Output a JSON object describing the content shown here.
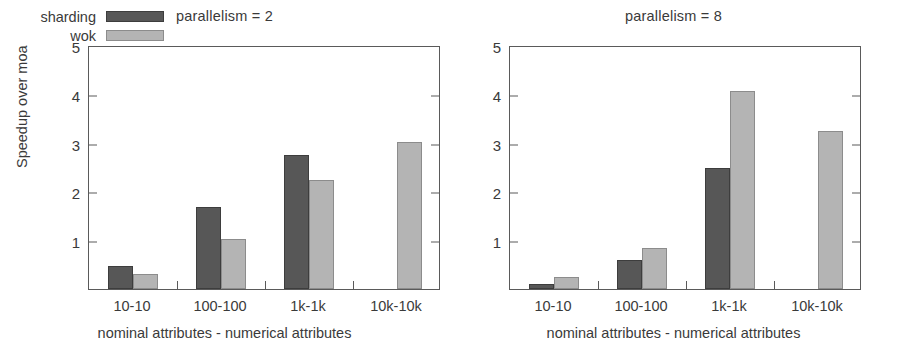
{
  "figure": {
    "y_axis_label": "Speedup over moa",
    "x_axis_label": "nominal attributes - numerical attributes",
    "y_ticks": [
      "1",
      "2",
      "3",
      "4",
      "5"
    ],
    "categories": [
      "10-10",
      "100-100",
      "1k-1k",
      "10k-10k"
    ],
    "legend": [
      {
        "label": "sharding",
        "color": "#575757"
      },
      {
        "label": "wok",
        "color": "#b4b4b4"
      }
    ]
  },
  "panels": [
    {
      "title": "parallelism = 2"
    },
    {
      "title": "parallelism = 8"
    }
  ],
  "chart_data": [
    {
      "type": "bar",
      "title": "parallelism = 2",
      "xlabel": "nominal attributes - numerical attributes",
      "ylabel": "Speedup over moa",
      "ylim": [
        0,
        5
      ],
      "yticks": [
        1,
        2,
        3,
        4,
        5
      ],
      "grid": false,
      "legend_position": "top-left-inside",
      "categories": [
        "10-10",
        "100-100",
        "1k-1k",
        "10k-10k"
      ],
      "series": [
        {
          "name": "sharding",
          "color": "#575757",
          "values": [
            0.48,
            1.68,
            2.74,
            0
          ]
        },
        {
          "name": "wok",
          "color": "#b4b4b4",
          "values": [
            0.31,
            1.02,
            2.24,
            3.02
          ]
        }
      ]
    },
    {
      "type": "bar",
      "title": "parallelism = 8",
      "xlabel": "nominal attributes - numerical attributes",
      "ylabel": "Speedup over moa",
      "ylim": [
        0,
        5
      ],
      "yticks": [
        1,
        2,
        3,
        4,
        5
      ],
      "grid": false,
      "legend_position": "none",
      "categories": [
        "10-10",
        "100-100",
        "1k-1k",
        "10k-10k"
      ],
      "series": [
        {
          "name": "sharding",
          "color": "#575757",
          "values": [
            0.1,
            0.6,
            2.47,
            0
          ]
        },
        {
          "name": "wok",
          "color": "#b4b4b4",
          "values": [
            0.25,
            0.84,
            4.05,
            3.23
          ]
        }
      ]
    }
  ]
}
